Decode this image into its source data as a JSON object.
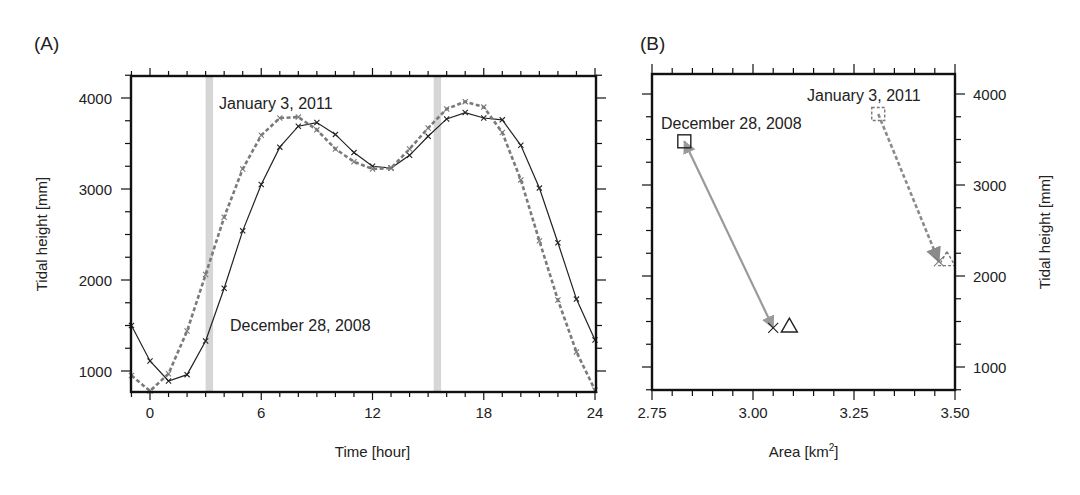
{
  "chart_data": [
    {
      "panel_label": "(A)",
      "type": "line",
      "title": "",
      "xlabel": "Time [hour]",
      "ylabel": "Tidal height [mm]",
      "xlim": [
        -1,
        24
      ],
      "ylim": [
        760,
        4250
      ],
      "xticks": [
        0,
        6,
        12,
        18,
        24
      ],
      "yticks": [
        1000,
        2000,
        3000,
        4000
      ],
      "grid": false,
      "legend": "none (series identified by in-plot annotations)",
      "shaded_bands": [
        {
          "x0": 3.0,
          "x1": 3.4,
          "color": "#cfcfcf"
        },
        {
          "x0": 15.3,
          "x1": 15.7,
          "color": "#cfcfcf"
        }
      ],
      "annotations": [
        {
          "text": "January 3, 2011",
          "x": 3.7,
          "y": 3870
        },
        {
          "text": "December 28, 2008",
          "x": 4.3,
          "y": 1420
        }
      ],
      "x": [
        -1,
        0,
        1,
        2,
        3,
        4,
        5,
        6,
        7,
        8,
        9,
        10,
        11,
        12,
        13,
        14,
        15,
        16,
        17,
        18,
        19,
        20,
        21,
        22,
        23,
        24
      ],
      "series": [
        {
          "name": "December 28, 2008",
          "style": "solid",
          "color": "#222222",
          "marker": "x",
          "values": [
            1500,
            1110,
            890,
            960,
            1330,
            1910,
            2540,
            3050,
            3460,
            3690,
            3730,
            3600,
            3400,
            3250,
            3230,
            3370,
            3580,
            3770,
            3840,
            3780,
            3760,
            3480,
            3010,
            2410,
            1790,
            1340
          ]
        },
        {
          "name": "January 3, 2011",
          "style": "dashed",
          "color": "#7a7a7a",
          "marker": "x",
          "values": [
            950,
            780,
            970,
            1440,
            2060,
            2690,
            3220,
            3590,
            3780,
            3790,
            3650,
            3440,
            3300,
            3220,
            3230,
            3440,
            3670,
            3880,
            3960,
            3900,
            3620,
            3100,
            2430,
            1780,
            1210,
            790
          ]
        }
      ]
    },
    {
      "panel_label": "(B)",
      "type": "scatter",
      "title": "",
      "xlabel": "Area [km",
      "xlabel_sup": "2",
      "xlabel_end": "]",
      "ylabel": "Tidal height [mm]",
      "ylabel_side": "right",
      "xlim": [
        2.75,
        3.5
      ],
      "ylim": [
        740,
        4250
      ],
      "xtick_labels": [
        "2.75",
        "3.00",
        "3.25",
        "3.50"
      ],
      "xticks": [
        2.75,
        3.0,
        3.25,
        3.5
      ],
      "yticks": [
        1000,
        2000,
        3000,
        4000
      ],
      "grid": false,
      "annotations": [
        {
          "text": "December 28, 2008",
          "x": 2.76,
          "y": 3800
        },
        {
          "text": "January 3, 2011",
          "x": 3.085,
          "y": 4010
        }
      ],
      "series": [
        {
          "name": "December 28, 2008",
          "style": "solid",
          "color": "#222222",
          "arrow_color": "#9a9a9a",
          "points": [
            {
              "marker": "square",
              "x": 2.83,
              "y": 3480
            },
            {
              "marker": "x",
              "x": 3.05,
              "y": 1430
            },
            {
              "marker": "triangle",
              "x": 3.09,
              "y": 1450
            }
          ],
          "arrow": {
            "from": [
              3.05,
              1430
            ],
            "to": [
              2.83,
              3480
            ],
            "double_headed": true
          }
        },
        {
          "name": "January 3, 2011",
          "style": "dashed",
          "color": "#7a7a7a",
          "arrow_color": "#8a8a8a",
          "points": [
            {
              "marker": "square",
              "x": 3.31,
              "y": 3780
            },
            {
              "marker": "x",
              "x": 3.46,
              "y": 2160
            },
            {
              "marker": "triangle",
              "x": 3.48,
              "y": 2180
            }
          ],
          "arrow": {
            "from": [
              3.31,
              3780
            ],
            "to": [
              3.46,
              2160
            ],
            "double_headed": false
          }
        }
      ]
    }
  ],
  "panels": {
    "a": {
      "label": "(A)"
    },
    "b": {
      "label": "(B)"
    }
  }
}
